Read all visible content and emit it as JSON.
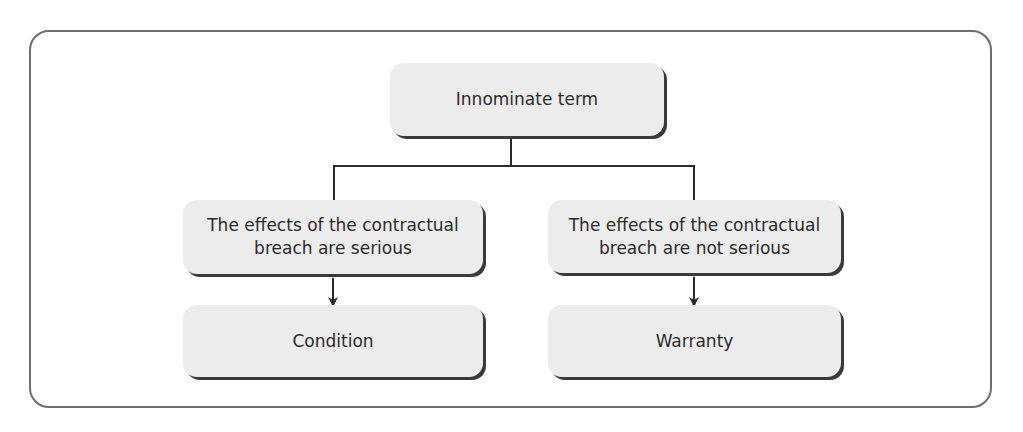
{
  "diagram": {
    "root": {
      "label": "Innominate term"
    },
    "branches": [
      {
        "condition": {
          "line1": "The effects of the contractual",
          "line2": "breach are serious"
        },
        "result": {
          "label": "Condition"
        }
      },
      {
        "condition": {
          "line1": "The effects of the contractual",
          "line2": "breach are not serious"
        },
        "result": {
          "label": "Warranty"
        }
      }
    ]
  },
  "colors": {
    "box_fill": "#ececec",
    "line": "#2b2b2b",
    "frame": "#6e6e6e",
    "text": "#2b2b2b"
  }
}
